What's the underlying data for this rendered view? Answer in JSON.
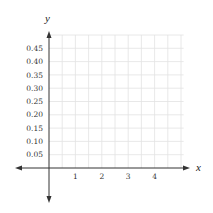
{
  "chart_data": {
    "type": "line",
    "title": "",
    "xlabel": "x",
    "ylabel": "y",
    "xlim": [
      -1.25,
      5.3
    ],
    "ylim": [
      -0.12,
      0.5
    ],
    "grid": true,
    "grid_x_step": 0.5,
    "grid_y_step": 0.05,
    "x_ticks": [
      1,
      2,
      3,
      4
    ],
    "x_tick_labels": [
      "1",
      "2",
      "3",
      "4"
    ],
    "y_ticks": [
      0.05,
      0.1,
      0.15,
      0.2,
      0.25,
      0.3,
      0.35,
      0.4,
      0.45
    ],
    "y_tick_labels": [
      "0.05",
      "0.10",
      "0.15",
      "0.20",
      "0.25",
      "0.30",
      "0.35",
      "0.40",
      "0.45"
    ],
    "series": [],
    "axes_arrows": true,
    "legend": null
  },
  "colors": {
    "grid": "#e2e2e2",
    "axis": "#333333",
    "text": "#333333",
    "background": "#ffffff"
  },
  "labels": {
    "x_axis": "x",
    "y_axis": "y",
    "x_ticks": [
      "1",
      "2",
      "3",
      "4"
    ],
    "y_ticks": [
      "0.05",
      "0.10",
      "0.15",
      "0.20",
      "0.25",
      "0.30",
      "0.35",
      "0.40",
      "0.45"
    ]
  }
}
